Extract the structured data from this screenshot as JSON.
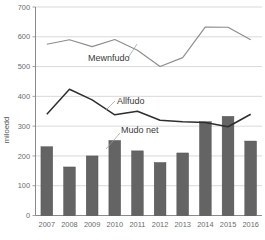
{
  "chart_data": {
    "type": "bar",
    "title": "",
    "subtitle": "",
    "xlabel": "",
    "ylabel": "miloedd",
    "categories": [
      "2007",
      "2008",
      "2009",
      "2010",
      "2011",
      "2012",
      "2013",
      "2014",
      "2015",
      "2016"
    ],
    "ylim": [
      0,
      700
    ],
    "yticks": [
      0,
      100,
      200,
      300,
      400,
      500,
      600,
      700
    ],
    "ytick_labels": [
      "0",
      "100",
      "200",
      "300",
      "400",
      "500",
      "600",
      "700"
    ],
    "grid": true,
    "legend_position": "inline-annotations",
    "series": [
      {
        "name": "Mewnfudo",
        "type": "line",
        "color": "#8d8d8d",
        "values": [
          575,
          590,
          567,
          591,
          555,
          500,
          530,
          633,
          632,
          590
        ]
      },
      {
        "name": "Allfudo",
        "type": "line",
        "color": "#2e2e2e",
        "values": [
          340,
          424,
          388,
          338,
          350,
          320,
          315,
          312,
          298,
          340
        ]
      },
      {
        "name": "Mudo net",
        "type": "bar",
        "color": "#646464",
        "values": [
          231,
          163,
          200,
          252,
          217,
          178,
          210,
          315,
          333,
          250
        ]
      }
    ],
    "annotations": [
      {
        "text": "Mewnfudo",
        "x_px": 88,
        "y_px": 60
      },
      {
        "text": "Allfudo",
        "x_px": 118,
        "y_px": 101
      },
      {
        "text": "Mudo net",
        "x_px": 122,
        "y_px": 131
      }
    ]
  },
  "axis": {
    "y_title": "miloedd",
    "y_ticks": [
      "700",
      "600",
      "500",
      "400",
      "300",
      "200",
      "100",
      "0"
    ],
    "x_ticks": [
      "2007",
      "2008",
      "2009",
      "2010",
      "2011",
      "2012",
      "2013",
      "2014",
      "2015",
      "2016"
    ]
  },
  "labels": {
    "immigration": "Mewnfudo",
    "emigration": "Allfudo",
    "net_migration": "Mudo net"
  },
  "colors": {
    "bar_fill": "#646464",
    "immigration_line": "#8d8d8d",
    "emigration_line": "#2e2e2e",
    "gridline": "#c9c9c9",
    "axis": "#8a8a8a",
    "tick_text": "#6b6b6b"
  }
}
